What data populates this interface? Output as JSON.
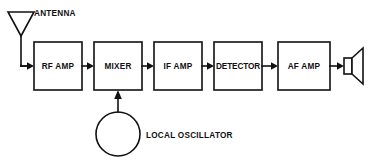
{
  "diagram": {
    "stroke_color": "#111111",
    "background_color": "#ffffff",
    "blocks": [
      {
        "id": "rf-amp",
        "label": "RF AMP",
        "x": 34,
        "y": 42,
        "w": 48,
        "h": 48
      },
      {
        "id": "mixer",
        "label": "MIXER",
        "x": 94,
        "y": 42,
        "w": 48,
        "h": 48
      },
      {
        "id": "if-amp",
        "label": "IF AMP",
        "x": 154,
        "y": 42,
        "w": 48,
        "h": 48
      },
      {
        "id": "detector",
        "label": "DETECTOR",
        "x": 214,
        "y": 42,
        "w": 48,
        "h": 48
      },
      {
        "id": "af-amp",
        "label": "AF AMP",
        "x": 278,
        "y": 42,
        "w": 52,
        "h": 48
      }
    ],
    "symbols": {
      "antenna": {
        "label": "ANTENNA",
        "label_x": 34,
        "label_y": 14
      },
      "local_oscillator": {
        "label": "LOCAL OSCILLATOR",
        "label_x": 146,
        "label_y": 136,
        "cx": 118,
        "cy": 134,
        "r": 22
      },
      "speaker": {
        "id": "speaker"
      }
    }
  }
}
